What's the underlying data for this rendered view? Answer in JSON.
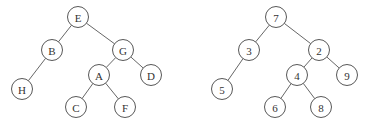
{
  "trees": [
    {
      "name": "letter-tree",
      "nodes": [
        {
          "id": "E",
          "label": "E",
          "x": 78,
          "y": 17
        },
        {
          "id": "B",
          "label": "B",
          "x": 52,
          "y": 50
        },
        {
          "id": "G",
          "label": "G",
          "x": 123,
          "y": 50
        },
        {
          "id": "H",
          "label": "H",
          "x": 22,
          "y": 89
        },
        {
          "id": "A",
          "label": "A",
          "x": 99,
          "y": 75
        },
        {
          "id": "D",
          "label": "D",
          "x": 151,
          "y": 75
        },
        {
          "id": "C",
          "label": "C",
          "x": 76,
          "y": 107
        },
        {
          "id": "F",
          "label": "F",
          "x": 125,
          "y": 107
        }
      ],
      "edges": [
        [
          "E",
          "B"
        ],
        [
          "E",
          "G"
        ],
        [
          "B",
          "H"
        ],
        [
          "G",
          "A"
        ],
        [
          "G",
          "D"
        ],
        [
          "A",
          "C"
        ],
        [
          "A",
          "F"
        ]
      ]
    },
    {
      "name": "number-tree",
      "nodes": [
        {
          "id": "7",
          "label": "7",
          "x": 276,
          "y": 17
        },
        {
          "id": "3",
          "label": "3",
          "x": 249,
          "y": 50
        },
        {
          "id": "2",
          "label": "2",
          "x": 319,
          "y": 50
        },
        {
          "id": "5",
          "label": "5",
          "x": 222,
          "y": 89
        },
        {
          "id": "4",
          "label": "4",
          "x": 297,
          "y": 75
        },
        {
          "id": "9",
          "label": "9",
          "x": 347,
          "y": 75
        },
        {
          "id": "6",
          "label": "6",
          "x": 275,
          "y": 107
        },
        {
          "id": "8",
          "label": "8",
          "x": 321,
          "y": 107
        }
      ],
      "edges": [
        [
          "7",
          "3"
        ],
        [
          "7",
          "2"
        ],
        [
          "3",
          "5"
        ],
        [
          "2",
          "4"
        ],
        [
          "2",
          "9"
        ],
        [
          "4",
          "6"
        ],
        [
          "4",
          "8"
        ]
      ]
    }
  ],
  "node_radius": 10.5
}
